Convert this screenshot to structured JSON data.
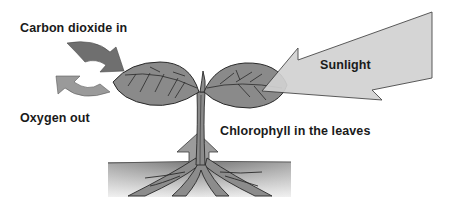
{
  "diagram": {
    "labels": {
      "carbon_dioxide": "Carbon dioxide in",
      "oxygen": "Oxygen out",
      "sunlight": "Sunlight",
      "chlorophyll": "Chlorophyll in the leaves"
    },
    "elements": [
      {
        "name": "carbon-dioxide-arrow",
        "direction": "into leaf",
        "color": "#6f6f6f"
      },
      {
        "name": "oxygen-arrow",
        "direction": "out of leaf",
        "color": "#9a9a9a"
      },
      {
        "name": "sunlight-arrow",
        "direction": "into leaf",
        "color": "#d2d2d2"
      },
      {
        "name": "water-up-arrow",
        "direction": "up the stem",
        "color": "#9c9c9c"
      },
      {
        "name": "plant",
        "parts": [
          "left-leaf",
          "right-leaf",
          "stem",
          "roots"
        ]
      },
      {
        "name": "soil"
      }
    ],
    "colors": {
      "leaf": "#8a8a8a",
      "outline": "#2a2a2a",
      "soil_top": "#7a7a7a",
      "soil_bottom": "#e6e6e6"
    }
  }
}
